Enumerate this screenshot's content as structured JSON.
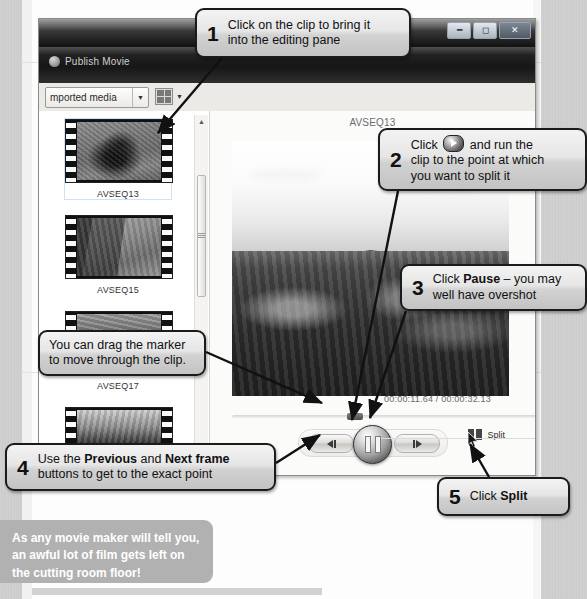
{
  "window": {
    "title_bar_buttons": [
      "minimize",
      "maximize",
      "close"
    ],
    "menu_item": "Publish Movie",
    "toolbar": {
      "media_dropdown_value": "mported media",
      "view_button": "view-options"
    }
  },
  "library": {
    "clips": [
      {
        "name": "AVSEQ13",
        "selected": true
      },
      {
        "name": "AVSEQ15",
        "selected": false
      },
      {
        "name": "AVSEQ17",
        "selected": false
      },
      {
        "name": "",
        "selected": false
      }
    ]
  },
  "preview": {
    "clip_name": "AVSEQ13",
    "timecode": "00:00:11.64 / 00:00:32.13",
    "transport": {
      "previous_frame": "Previous frame",
      "pause": "Pause",
      "next_frame": "Next frame"
    },
    "split_label": "Split"
  },
  "callouts": [
    {
      "id": "c1",
      "number": "1",
      "lines": [
        {
          "segments": [
            {
              "t": "Click on the clip to bring it",
              "b": false
            }
          ]
        },
        {
          "segments": [
            {
              "t": "into the editing pane",
              "b": false
            }
          ]
        }
      ]
    },
    {
      "id": "c2",
      "number": "2",
      "lines": [
        {
          "segments": [
            {
              "t": "Click ",
              "b": false
            },
            {
              "t": "@play",
              "b": false
            },
            {
              "t": " and run the",
              "b": false
            }
          ]
        },
        {
          "segments": [
            {
              "t": "clip to the point at which",
              "b": false
            }
          ]
        },
        {
          "segments": [
            {
              "t": "you want to split it",
              "b": false
            }
          ]
        }
      ]
    },
    {
      "id": "c3",
      "number": "3",
      "lines": [
        {
          "segments": [
            {
              "t": "Click ",
              "b": false
            },
            {
              "t": "Pause",
              "b": true
            },
            {
              "t": " – you may",
              "b": false
            }
          ]
        },
        {
          "segments": [
            {
              "t": "well have overshot",
              "b": false
            }
          ]
        }
      ]
    },
    {
      "id": "cmark",
      "number": "",
      "lines": [
        {
          "segments": [
            {
              "t": "You can drag the marker",
              "b": false
            }
          ]
        },
        {
          "segments": [
            {
              "t": "to move through the clip.",
              "b": false
            }
          ]
        }
      ]
    },
    {
      "id": "c4",
      "number": "4",
      "lines": [
        {
          "segments": [
            {
              "t": "Use the ",
              "b": false
            },
            {
              "t": "Previous",
              "b": true
            },
            {
              "t": " and ",
              "b": false
            },
            {
              "t": "Next frame",
              "b": true
            }
          ]
        },
        {
          "segments": [
            {
              "t": "buttons to get to the exact point",
              "b": false
            }
          ]
        }
      ]
    },
    {
      "id": "c5",
      "number": "5",
      "lines": [
        {
          "segments": [
            {
              "t": "Click ",
              "b": false
            },
            {
              "t": "Split",
              "b": true
            }
          ]
        }
      ]
    }
  ],
  "tip": {
    "lines": [
      "As any movie maker will tell you,",
      "an awful lot of film gets left on",
      "the cutting room floor!"
    ]
  },
  "colors": {
    "callout_border": "#1b1b1b",
    "callout_fill_top": "#f3f3f3",
    "callout_fill_bottom": "#c3c3c3",
    "tip_background": "#b1b1b1",
    "tip_text": "#ffffff",
    "window_chrome_dark": "#161616"
  }
}
